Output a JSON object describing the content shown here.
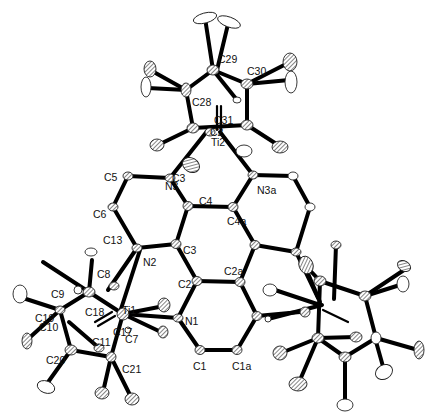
{
  "figure": {
    "type": "ORTEP molecular structure",
    "background": "#ffffff",
    "bond_color": "#000000"
  },
  "labels": [
    {
      "id": "C29",
      "text": "C29",
      "x": 218,
      "y": 63
    },
    {
      "id": "C30",
      "text": "C30",
      "x": 247,
      "y": 75
    },
    {
      "id": "C28",
      "text": "C28",
      "x": 192,
      "y": 106
    },
    {
      "id": "C31",
      "text": "C31",
      "x": 214,
      "y": 124
    },
    {
      "id": "C27",
      "text": "C2",
      "x": 210,
      "y": 136
    },
    {
      "id": "Ti2",
      "text": "Ti2",
      "x": 211,
      "y": 146
    },
    {
      "id": "C5",
      "text": "C5",
      "x": 119,
      "y": 184
    },
    {
      "id": "C36",
      "text": "C3",
      "x": 172,
      "y": 180
    },
    {
      "id": "N3",
      "text": "N3",
      "x": 168,
      "y": 188
    },
    {
      "id": "N3a",
      "text": "N3a",
      "x": 257,
      "y": 192
    },
    {
      "id": "C4",
      "text": "C4",
      "x": 203,
      "y": 206
    },
    {
      "id": "C6",
      "text": "C6",
      "x": 101,
      "y": 216
    },
    {
      "id": "C4a",
      "text": "C4a",
      "x": 238,
      "y": 227
    },
    {
      "id": "C13",
      "text": "C13",
      "x": 103,
      "y": 244
    },
    {
      "id": "C3",
      "text": "C3",
      "x": 184,
      "y": 251
    },
    {
      "id": "N2",
      "text": "N2",
      "x": 143,
      "y": 264
    },
    {
      "id": "C2a",
      "text": "C2a",
      "x": 226,
      "y": 274
    },
    {
      "id": "C8",
      "text": "C8",
      "x": 98,
      "y": 278
    },
    {
      "id": "C2",
      "text": "C2",
      "x": 178,
      "y": 287
    },
    {
      "id": "C9",
      "text": "C9",
      "x": 53,
      "y": 296
    },
    {
      "id": "Ti1",
      "text": "Ti1",
      "x": 122,
      "y": 311
    },
    {
      "id": "C18",
      "text": "C18",
      "x": 87,
      "y": 313
    },
    {
      "id": "N1",
      "text": "N1",
      "x": 181,
      "y": 323
    },
    {
      "id": "C19",
      "text": "C19",
      "x": 37,
      "y": 320
    },
    {
      "id": "C10",
      "text": "C10",
      "x": 40,
      "y": 329
    },
    {
      "id": "C17",
      "text": "C17",
      "x": 113,
      "y": 334
    },
    {
      "id": "C7",
      "text": "C7",
      "x": 125,
      "y": 340
    },
    {
      "id": "C11",
      "text": "C11",
      "x": 93,
      "y": 344
    },
    {
      "id": "C20",
      "text": "C20",
      "x": 47,
      "y": 362
    },
    {
      "id": "C1",
      "text": "C1",
      "x": 194,
      "y": 367
    },
    {
      "id": "C1a",
      "text": "C1a",
      "x": 232,
      "y": 367
    },
    {
      "id": "C21",
      "text": "C21",
      "x": 122,
      "y": 371
    }
  ]
}
